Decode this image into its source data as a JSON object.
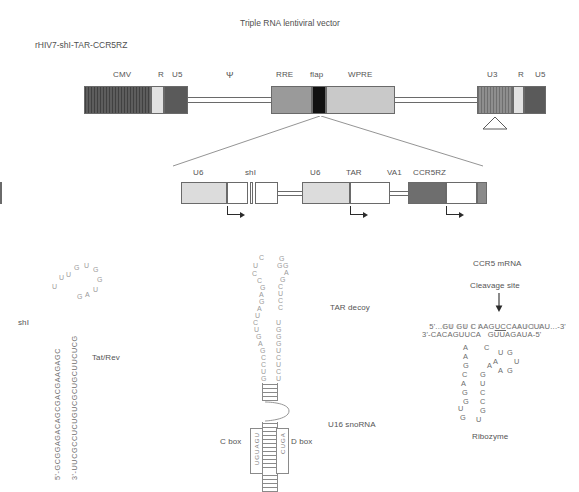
{
  "figure": {
    "title": "Triple RNA lentiviral vector",
    "construct_name": "rHIV7-shI-TAR-CCR5RZ"
  },
  "vector_map": {
    "elements": [
      {
        "label": "CMV",
        "fill": "#5d5d5d",
        "style": "hatch-dark"
      },
      {
        "label": "R",
        "fill": "#e2e2e2",
        "style": "solid-light"
      },
      {
        "label": "U5",
        "fill": "#5a5a5a",
        "style": "solid-dark"
      },
      {
        "label": "Ψ",
        "fill": "none",
        "style": "line"
      },
      {
        "label": "RRE",
        "fill": "#9a9a9a",
        "style": "solid-mid"
      },
      {
        "label": "flap",
        "fill": "#111111",
        "style": "solid-black"
      },
      {
        "label": "WPRE",
        "fill": "#c9c9c9",
        "style": "solid-litegray"
      },
      {
        "label": "U3",
        "fill": "#8e8e8e",
        "style": "hatch-mid"
      },
      {
        "label": "R",
        "fill": "#e2e2e2",
        "style": "solid-light"
      },
      {
        "label": "U5",
        "fill": "#5a5a5a",
        "style": "solid-dark"
      }
    ]
  },
  "cassette": {
    "elements": [
      {
        "label": "U6",
        "fill": "#dcdcdc"
      },
      {
        "label": "shI",
        "fill": "#ffffff"
      },
      {
        "label": "U6",
        "fill": "#dcdcdc"
      },
      {
        "label": "TAR",
        "fill": "#ffffff"
      },
      {
        "label": "VA1",
        "fill": "#6e6e6e"
      },
      {
        "label": "CCR5RZ",
        "fill": "#ffffff"
      }
    ],
    "promoter_arrows": 3
  },
  "shi_panel": {
    "label": "shI",
    "target_label": "Tat/Rev",
    "top_strand": "5'-GCGGAGACAGCGACGAAGAGC",
    "bottom_strand": "3'-UUCGCCUCUGUCGCUGCUUCUCG",
    "loop_left": "U U U G",
    "loop_right": "U G G U A G",
    "loop_nts": [
      "U",
      "U",
      "U",
      "G",
      "U",
      "G",
      "G",
      "U",
      "A",
      "G"
    ]
  },
  "tar_panel": {
    "label": "TAR decoy",
    "scaffold_label": "U16 snoRNA",
    "c_box_label": "C box",
    "d_box_label": "D box",
    "c_box_seq": "UGUAGU",
    "d_box_seq": "CUGA",
    "loop_left_nts": [
      "U",
      "C",
      "C",
      "C",
      "G",
      "A",
      "G",
      "A",
      "U",
      "C",
      "U",
      "G",
      "A",
      "G",
      "C",
      "C",
      "U",
      "G"
    ],
    "loop_right_nts": [
      "G",
      "G",
      "G",
      "A",
      "G",
      "C",
      "U",
      "C",
      "C",
      "U",
      "G",
      "G",
      "G",
      "U",
      "C",
      "U",
      "C",
      "U"
    ]
  },
  "ribozyme_panel": {
    "title": "CCR5 mRNA",
    "cleavage_label": "Cleavage site",
    "label": "Ribozyme",
    "target_strand_prefix": "5'...GU GU C AAG",
    "target_strand_cleave": "UC",
    "target_strand_suffix": "CAAUCUAU...-3'",
    "ribozyme_strand": "3'-CACAGUUCA   GUUAGAUA-5'",
    "catalytic_left": [
      "A",
      "A",
      "G",
      "C",
      "A",
      "G",
      "G",
      "U",
      "G"
    ],
    "catalytic_right": [
      "C",
      "A",
      "G",
      "U",
      "C",
      "C",
      "G",
      "U"
    ],
    "catalytic_mid": [
      "U",
      "G",
      "A",
      "G",
      "U",
      "A"
    ]
  }
}
